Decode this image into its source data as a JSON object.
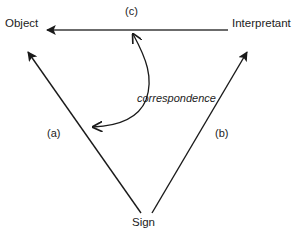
{
  "diagram": {
    "background_color": "#ffffff",
    "line_color": "#1a1a1a",
    "vertices": {
      "object": "Object",
      "interpretant": "Interpretant",
      "sign": "Sign"
    },
    "edge_labels": {
      "left": "(a)",
      "right": "(b)",
      "top": "(c)"
    },
    "annotation": "correspondence",
    "relations": [
      {
        "id": "a",
        "from": "Sign",
        "to": "Object",
        "label": "(a)",
        "arrow": "single"
      },
      {
        "id": "b",
        "from": "Sign",
        "to": "Interpretant",
        "label": "(b)",
        "arrow": "single"
      },
      {
        "id": "c",
        "from": "Interpretant",
        "to": "Object",
        "label": "(c)",
        "arrow": "single"
      },
      {
        "id": "correspondence",
        "from": "(c) edge",
        "to": "(a) edge",
        "label": "correspondence",
        "arrow": "double-curved"
      }
    ]
  }
}
